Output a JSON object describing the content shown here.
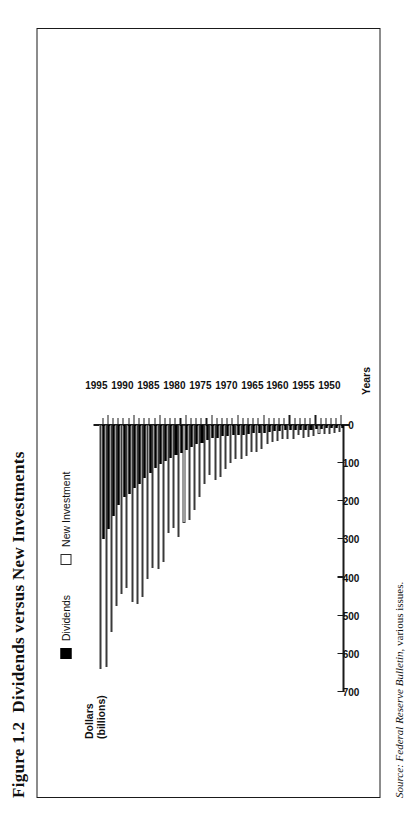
{
  "figure": {
    "number": "Figure 1.2",
    "title": "Dividends versus New Investments"
  },
  "source": {
    "lead": "Source:",
    "publication": "Federal Reserve Bulletin",
    "suffix": ", various issues."
  },
  "legend": {
    "position": "top-left",
    "items": [
      {
        "label": "Dividends",
        "swatch": "filled-square",
        "color": "#000000"
      },
      {
        "label": "New Investment",
        "swatch": "hollow-square",
        "color": "#ffffff"
      }
    ]
  },
  "axes": {
    "value_axis_title_line1": "Dollars",
    "value_axis_title_line2": "(billions)",
    "category_axis_title": "Years",
    "value_ticks": [
      0,
      100,
      200,
      300,
      400,
      500,
      600,
      700
    ],
    "category_ticks": [
      1950,
      1955,
      1960,
      1965,
      1970,
      1975,
      1980,
      1985,
      1990,
      1995
    ]
  },
  "chart_data": {
    "type": "bar",
    "orientation": "horizontal",
    "title": "Dividends versus New Investments",
    "xlabel": "Years",
    "ylabel": "Dollars (billions)",
    "ylim": [
      0,
      700
    ],
    "grid": false,
    "legend_position": "top-left",
    "categories": [
      1950,
      1951,
      1952,
      1953,
      1954,
      1955,
      1956,
      1957,
      1958,
      1959,
      1960,
      1961,
      1962,
      1963,
      1964,
      1965,
      1966,
      1967,
      1968,
      1969,
      1970,
      1971,
      1972,
      1973,
      1974,
      1975,
      1976,
      1977,
      1978,
      1979,
      1980,
      1981,
      1982,
      1983,
      1984,
      1985,
      1986,
      1987,
      1988,
      1989,
      1990,
      1991,
      1992,
      1993,
      1994,
      1995,
      1996
    ],
    "series": [
      {
        "name": "Dividends",
        "color": "#000000",
        "values": [
          9,
          9,
          9,
          9,
          10,
          11,
          12,
          12,
          12,
          13,
          14,
          14,
          16,
          17,
          19,
          21,
          22,
          22,
          24,
          25,
          25,
          26,
          28,
          30,
          33,
          33,
          40,
          46,
          51,
          59,
          65,
          74,
          79,
          86,
          95,
          101,
          113,
          125,
          138,
          156,
          166,
          180,
          190,
          211,
          239,
          273,
          300
        ]
      },
      {
        "name": "New Investment",
        "color": "#ffffff",
        "values": [
          19,
          22,
          23,
          24,
          23,
          29,
          32,
          33,
          27,
          36,
          36,
          37,
          42,
          45,
          50,
          63,
          72,
          72,
          81,
          90,
          89,
          99,
          115,
          136,
          145,
          131,
          155,
          190,
          222,
          250,
          257,
          294,
          271,
          283,
          358,
          378,
          375,
          404,
          452,
          470,
          464,
          427,
          442,
          475,
          542,
          635,
          640
        ]
      }
    ],
    "max_value": 700,
    "n_years": 47
  }
}
